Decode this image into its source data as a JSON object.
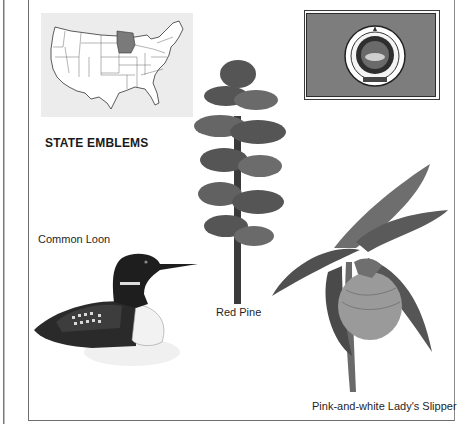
{
  "page": {
    "title": "STATE EMBLEMS",
    "map": {
      "label": "US map with Minnesota highlighted",
      "highlight_color": "#7a7a7a",
      "background": "#ececec"
    },
    "flag": {
      "label": "State flag",
      "field_color": "#7d7d7d",
      "seal_label": "State seal"
    },
    "emblems": [
      {
        "name": "Common Loon",
        "kind": "bird"
      },
      {
        "name": "Red Pine",
        "kind": "tree"
      },
      {
        "name": "Pink-and-white Lady's Slipper",
        "kind": "flower"
      }
    ]
  }
}
